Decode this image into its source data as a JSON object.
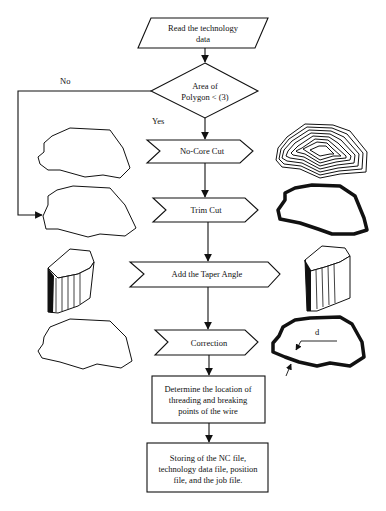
{
  "flowchart": {
    "start": {
      "line1": "Read the technology",
      "line2": "data"
    },
    "decision": {
      "line1": "Area of",
      "line2": "Polygon < (3)",
      "yes_label": "Yes",
      "no_label": "No"
    },
    "steps": [
      {
        "label": "No-Core Cut"
      },
      {
        "label": "Trim Cut"
      },
      {
        "label": "Add the Taper Angle"
      },
      {
        "label": "Correction"
      }
    ],
    "process_boxes": [
      {
        "lines": [
          "Determine the location of",
          "threading and breaking",
          "points of the wire"
        ]
      },
      {
        "lines": [
          "Storing of the NC file,",
          "technology data file, position",
          "file, and the job file."
        ]
      }
    ],
    "illustrations": {
      "correction_dimension_label": "d"
    }
  },
  "colors": {
    "line": "#111111",
    "background": "#ffffff"
  }
}
